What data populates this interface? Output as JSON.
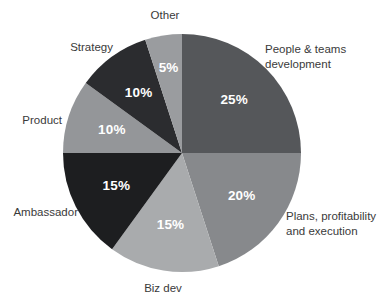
{
  "chart_data": {
    "type": "pie",
    "title": "",
    "subtitle": "",
    "xlabel": "",
    "ylabel": "",
    "legend_position": "callout-labels-around-pie",
    "grid": false,
    "start_angle_deg": 0,
    "direction": "clockwise",
    "value_unit": "%",
    "categories": [
      "People & teams development",
      "Plans, profitability and execution",
      "Biz dev",
      "Ambassador",
      "Product",
      "Strategy",
      "Other"
    ],
    "values": [
      25,
      20,
      15,
      15,
      10,
      10,
      5
    ],
    "value_labels": [
      "25%",
      "20%",
      "15%",
      "15%",
      "10%",
      "10%",
      "5%"
    ],
    "colors": [
      "#55575a",
      "#87898c",
      "#a9abad",
      "#1d1e20",
      "#949699",
      "#2b2c2f",
      "#9a9c9f"
    ],
    "slices": [
      {
        "name": "People & teams development",
        "value": 25,
        "value_label": "25%",
        "color": "#55575a",
        "label_line1": "People & teams",
        "label_line2": "development"
      },
      {
        "name": "Plans, profitability and execution",
        "value": 20,
        "value_label": "20%",
        "color": "#87898c",
        "label_line1": "Plans, profitability",
        "label_line2": "and execution"
      },
      {
        "name": "Biz dev",
        "value": 15,
        "value_label": "15%",
        "color": "#a9abad",
        "label_line1": "Biz dev",
        "label_line2": ""
      },
      {
        "name": "Ambassador",
        "value": 15,
        "value_label": "15%",
        "color": "#1d1e20",
        "label_line1": "Ambassador",
        "label_line2": ""
      },
      {
        "name": "Product",
        "value": 10,
        "value_label": "10%",
        "color": "#949699",
        "label_line1": "Product",
        "label_line2": ""
      },
      {
        "name": "Strategy",
        "value": 10,
        "value_label": "10%",
        "color": "#2b2c2f",
        "label_line1": "Strategy",
        "label_line2": ""
      },
      {
        "name": "Other",
        "value": 5,
        "value_label": "5%",
        "color": "#9a9c9f",
        "label_line1": "Other",
        "label_line2": ""
      }
    ],
    "geometry": {
      "center_x": 182,
      "center_y": 153,
      "radius": 119
    },
    "background_color": "#ffffff",
    "label_text_color": "#3a3a3a",
    "value_text_color": "#ffffff"
  }
}
